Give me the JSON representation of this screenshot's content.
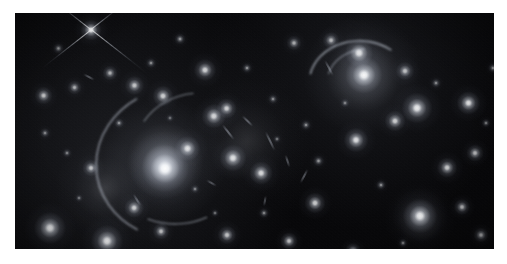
{
  "image": {
    "kind": "astronomical-photograph",
    "subject": "galaxy cluster with gravitational lensing arcs",
    "canvas_width": 507,
    "canvas_height": 264,
    "border_color": "#ffffff",
    "sky_background_color": "#040406",
    "plate": {
      "left": 15,
      "top": 13,
      "width": 479,
      "height": 236
    }
  },
  "diffuse_halos": [
    {
      "name": "central-cd-galaxy-halo",
      "cx": 150,
      "cy": 148,
      "rx": 118,
      "ry": 62,
      "rot": -24,
      "peak": 0.42,
      "color": "#dfe4ee"
    },
    {
      "name": "central-cd-galaxy-core-halo",
      "cx": 148,
      "cy": 152,
      "rx": 60,
      "ry": 34,
      "rot": -24,
      "peak": 0.55,
      "color": "#eef1f7"
    },
    {
      "name": "northeast-group-halo",
      "cx": 348,
      "cy": 62,
      "rx": 78,
      "ry": 60,
      "rot": 0,
      "peak": 0.34,
      "color": "#dde2ec"
    },
    {
      "name": "intracluster-light-west",
      "cx": 90,
      "cy": 175,
      "rx": 70,
      "ry": 50,
      "rot": 10,
      "peak": 0.16,
      "color": "#c9cedb"
    },
    {
      "name": "intracluster-light-center",
      "cx": 232,
      "cy": 128,
      "rx": 86,
      "ry": 64,
      "rot": 0,
      "peak": 0.13,
      "color": "#c4c9d6"
    },
    {
      "name": "southeast-group-halo",
      "cx": 405,
      "cy": 206,
      "rx": 46,
      "ry": 36,
      "rot": 0,
      "peak": 0.18,
      "color": "#d6dbe5"
    }
  ],
  "objects": [
    {
      "name": "bright-star-with-diffraction-spikes",
      "type": "star",
      "cx": 76,
      "cy": 17,
      "r": 5.2,
      "mag": 1.0,
      "ell": 1.0,
      "rot": 0
    },
    {
      "name": "central-cd-galaxy-nucleus",
      "type": "elliptical-galaxy",
      "cx": 150,
      "cy": 155,
      "r": 12.0,
      "mag": 0.98,
      "ell": 1.15,
      "rot": -22
    },
    {
      "name": "galaxy-ne-bright-a",
      "type": "elliptical-galaxy",
      "cx": 349,
      "cy": 62,
      "r": 9.5,
      "mag": 0.96,
      "ell": 1.05,
      "rot": 0
    },
    {
      "name": "galaxy-ne-bright-b",
      "type": "elliptical-galaxy",
      "cx": 344,
      "cy": 40,
      "r": 7.2,
      "mag": 0.88,
      "ell": 1.0,
      "rot": 0
    },
    {
      "name": "galaxy-e-bright",
      "type": "elliptical-galaxy",
      "cx": 402,
      "cy": 95,
      "r": 7.8,
      "mag": 0.92,
      "ell": 1.0,
      "rot": 0
    },
    {
      "name": "galaxy-se-bright",
      "type": "elliptical-galaxy",
      "cx": 405,
      "cy": 203,
      "r": 8.6,
      "mag": 0.95,
      "ell": 1.0,
      "rot": 0
    },
    {
      "name": "galaxy-sw-bright-a",
      "type": "elliptical-galaxy",
      "cx": 35,
      "cy": 215,
      "r": 8.2,
      "mag": 0.93,
      "ell": 1.05,
      "rot": 0
    },
    {
      "name": "galaxy-sw-bright-b",
      "type": "elliptical-galaxy",
      "cx": 92,
      "cy": 228,
      "r": 8.0,
      "mag": 0.92,
      "ell": 1.0,
      "rot": 0
    },
    {
      "name": "galaxy-edge-on-spiral",
      "type": "edge-on-spiral",
      "cx": 453,
      "cy": 90,
      "r": 6.0,
      "mag": 0.9,
      "ell": 3.4,
      "rot": -8
    },
    {
      "name": "galaxy-center-north",
      "type": "elliptical-galaxy",
      "cx": 173,
      "cy": 135,
      "r": 6.4,
      "mag": 0.86,
      "ell": 1.1,
      "rot": -20
    },
    {
      "name": "galaxy-center-east",
      "type": "elliptical-galaxy",
      "cx": 218,
      "cy": 145,
      "r": 6.8,
      "mag": 0.88,
      "ell": 1.15,
      "rot": 10
    },
    {
      "name": "galaxy-center-lens-a",
      "type": "elliptical-galaxy",
      "cx": 199,
      "cy": 103,
      "r": 6.2,
      "mag": 0.84,
      "ell": 1.3,
      "rot": 35
    },
    {
      "name": "galaxy-center-lens-b",
      "type": "elliptical-galaxy",
      "cx": 212,
      "cy": 96,
      "r": 5.2,
      "mag": 0.8,
      "ell": 1.6,
      "rot": 40
    },
    {
      "name": "galaxy-mid-north",
      "type": "elliptical-galaxy",
      "cx": 190,
      "cy": 57,
      "r": 5.6,
      "mag": 0.82,
      "ell": 1.0,
      "rot": 0
    },
    {
      "name": "galaxy-mid-east",
      "type": "elliptical-galaxy",
      "cx": 246,
      "cy": 160,
      "r": 6.0,
      "mag": 0.85,
      "ell": 1.4,
      "rot": 25
    },
    {
      "name": "galaxy-east-field-a",
      "type": "elliptical-galaxy",
      "cx": 341,
      "cy": 127,
      "r": 6.4,
      "mag": 0.87,
      "ell": 1.15,
      "rot": 0
    },
    {
      "name": "galaxy-east-field-b",
      "type": "elliptical-galaxy",
      "cx": 380,
      "cy": 108,
      "r": 5.4,
      "mag": 0.8,
      "ell": 1.1,
      "rot": 0
    },
    {
      "name": "galaxy-east-field-c",
      "type": "elliptical-galaxy",
      "cx": 432,
      "cy": 155,
      "r": 5.2,
      "mag": 0.78,
      "ell": 1.5,
      "rot": 70
    },
    {
      "name": "galaxy-east-field-d",
      "type": "elliptical-galaxy",
      "cx": 460,
      "cy": 140,
      "r": 4.4,
      "mag": 0.72,
      "ell": 1.2,
      "rot": 0
    },
    {
      "name": "galaxy-ne-field-a",
      "type": "elliptical-galaxy",
      "cx": 390,
      "cy": 58,
      "r": 4.6,
      "mag": 0.74,
      "ell": 1.3,
      "rot": 0
    },
    {
      "name": "galaxy-ne-field-b",
      "type": "elliptical-galaxy",
      "cx": 316,
      "cy": 27,
      "r": 4.2,
      "mag": 0.7,
      "ell": 2.1,
      "rot": 60
    },
    {
      "name": "galaxy-ne-field-c",
      "type": "elliptical-galaxy",
      "cx": 279,
      "cy": 30,
      "r": 3.6,
      "mag": 0.66,
      "ell": 1.0,
      "rot": 0
    },
    {
      "name": "galaxy-nw-field-a",
      "type": "elliptical-galaxy",
      "cx": 120,
      "cy": 72,
      "r": 4.8,
      "mag": 0.76,
      "ell": 1.6,
      "rot": 45
    },
    {
      "name": "galaxy-nw-field-b",
      "type": "elliptical-galaxy",
      "cx": 148,
      "cy": 83,
      "r": 5.4,
      "mag": 0.8,
      "ell": 1.25,
      "rot": 0
    },
    {
      "name": "galaxy-nw-field-c",
      "type": "elliptical-galaxy",
      "cx": 95,
      "cy": 60,
      "r": 3.8,
      "mag": 0.68,
      "ell": 1.0,
      "rot": 0
    },
    {
      "name": "galaxy-w-field-a",
      "type": "elliptical-galaxy",
      "cx": 28,
      "cy": 83,
      "r": 4.6,
      "mag": 0.76,
      "ell": 2.0,
      "rot": 25
    },
    {
      "name": "galaxy-w-field-b",
      "type": "elliptical-galaxy",
      "cx": 60,
      "cy": 75,
      "r": 3.6,
      "mag": 0.66,
      "ell": 1.7,
      "rot": 40
    },
    {
      "name": "galaxy-w-field-c",
      "type": "elliptical-galaxy",
      "cx": 76,
      "cy": 155,
      "r": 4.4,
      "mag": 0.74,
      "ell": 1.1,
      "rot": 0
    },
    {
      "name": "galaxy-sw-field-a",
      "type": "elliptical-galaxy",
      "cx": 119,
      "cy": 195,
      "r": 5.0,
      "mag": 0.79,
      "ell": 1.7,
      "rot": 60
    },
    {
      "name": "galaxy-sw-field-b",
      "type": "elliptical-galaxy",
      "cx": 146,
      "cy": 218,
      "r": 4.2,
      "mag": 0.72,
      "ell": 1.5,
      "rot": 55
    },
    {
      "name": "galaxy-s-field-a",
      "type": "elliptical-galaxy",
      "cx": 212,
      "cy": 222,
      "r": 4.6,
      "mag": 0.76,
      "ell": 1.1,
      "rot": 0
    },
    {
      "name": "galaxy-s-field-b",
      "type": "elliptical-galaxy",
      "cx": 274,
      "cy": 228,
      "r": 4.4,
      "mag": 0.74,
      "ell": 1.0,
      "rot": 0
    },
    {
      "name": "galaxy-s-field-c",
      "type": "elliptical-galaxy",
      "cx": 300,
      "cy": 190,
      "r": 5.2,
      "mag": 0.79,
      "ell": 1.0,
      "rot": 0
    },
    {
      "name": "galaxy-s-field-d",
      "type": "elliptical-galaxy",
      "cx": 338,
      "cy": 238,
      "r": 4.0,
      "mag": 0.7,
      "ell": 1.0,
      "rot": 0
    },
    {
      "name": "galaxy-se-field-a",
      "type": "elliptical-galaxy",
      "cx": 447,
      "cy": 194,
      "r": 4.2,
      "mag": 0.72,
      "ell": 1.0,
      "rot": 0
    },
    {
      "name": "galaxy-se-field-b",
      "type": "elliptical-galaxy",
      "cx": 466,
      "cy": 222,
      "r": 3.8,
      "mag": 0.68,
      "ell": 1.4,
      "rot": 0
    },
    {
      "name": "galaxy-field-029",
      "type": "faint",
      "cx": 44,
      "cy": 35,
      "r": 2.6,
      "mag": 0.55,
      "ell": 1.4,
      "rot": 30
    },
    {
      "name": "galaxy-field-030",
      "type": "faint",
      "cx": 30,
      "cy": 120,
      "r": 2.4,
      "mag": 0.52,
      "ell": 1.0,
      "rot": 0
    },
    {
      "name": "galaxy-field-031",
      "type": "faint",
      "cx": 52,
      "cy": 140,
      "r": 2.2,
      "mag": 0.5,
      "ell": 1.0,
      "rot": 0
    },
    {
      "name": "galaxy-field-032",
      "type": "faint",
      "cx": 104,
      "cy": 110,
      "r": 2.6,
      "mag": 0.56,
      "ell": 1.2,
      "rot": 0
    },
    {
      "name": "galaxy-field-033",
      "type": "faint",
      "cx": 136,
      "cy": 50,
      "r": 2.4,
      "mag": 0.54,
      "ell": 1.0,
      "rot": 0
    },
    {
      "name": "galaxy-field-034",
      "type": "faint",
      "cx": 165,
      "cy": 26,
      "r": 2.8,
      "mag": 0.58,
      "ell": 1.0,
      "rot": 0
    },
    {
      "name": "galaxy-field-035",
      "type": "faint",
      "cx": 232,
      "cy": 55,
      "r": 2.6,
      "mag": 0.56,
      "ell": 1.0,
      "rot": 0
    },
    {
      "name": "galaxy-field-036",
      "type": "faint",
      "cx": 258,
      "cy": 86,
      "r": 2.4,
      "mag": 0.53,
      "ell": 1.0,
      "rot": 0
    },
    {
      "name": "galaxy-field-037",
      "type": "faint",
      "cx": 291,
      "cy": 112,
      "r": 2.6,
      "mag": 0.55,
      "ell": 1.0,
      "rot": 0
    },
    {
      "name": "galaxy-field-038",
      "type": "faint",
      "cx": 304,
      "cy": 148,
      "r": 2.8,
      "mag": 0.58,
      "ell": 1.3,
      "rot": 20
    },
    {
      "name": "galaxy-field-039",
      "type": "faint",
      "cx": 366,
      "cy": 172,
      "r": 2.6,
      "mag": 0.55,
      "ell": 1.0,
      "rot": 0
    },
    {
      "name": "galaxy-field-040",
      "type": "faint",
      "cx": 421,
      "cy": 70,
      "r": 2.4,
      "mag": 0.53,
      "ell": 1.0,
      "rot": 0
    },
    {
      "name": "galaxy-field-041",
      "type": "faint",
      "cx": 478,
      "cy": 55,
      "r": 2.6,
      "mag": 0.56,
      "ell": 1.0,
      "rot": 0
    },
    {
      "name": "galaxy-field-042",
      "type": "faint",
      "cx": 471,
      "cy": 110,
      "r": 2.2,
      "mag": 0.5,
      "ell": 1.0,
      "rot": 0
    },
    {
      "name": "galaxy-field-043",
      "type": "faint",
      "cx": 249,
      "cy": 200,
      "r": 2.4,
      "mag": 0.52,
      "ell": 1.0,
      "rot": 0
    },
    {
      "name": "galaxy-field-044",
      "type": "faint",
      "cx": 180,
      "cy": 176,
      "r": 2.2,
      "mag": 0.5,
      "ell": 1.0,
      "rot": 0
    },
    {
      "name": "galaxy-field-045",
      "type": "faint",
      "cx": 200,
      "cy": 200,
      "r": 2.0,
      "mag": 0.46,
      "ell": 1.0,
      "rot": 0
    },
    {
      "name": "galaxy-field-046",
      "type": "faint",
      "cx": 388,
      "cy": 230,
      "r": 2.2,
      "mag": 0.5,
      "ell": 1.0,
      "rot": 0
    },
    {
      "name": "galaxy-field-047",
      "type": "faint",
      "cx": 64,
      "cy": 185,
      "r": 2.0,
      "mag": 0.46,
      "ell": 1.0,
      "rot": 0
    },
    {
      "name": "galaxy-field-048",
      "type": "faint",
      "cx": 262,
      "cy": 126,
      "r": 2.0,
      "mag": 0.46,
      "ell": 1.0,
      "rot": 0
    },
    {
      "name": "galaxy-field-049",
      "type": "faint",
      "cx": 330,
      "cy": 90,
      "r": 2.2,
      "mag": 0.5,
      "ell": 1.0,
      "rot": 0
    },
    {
      "name": "galaxy-field-050",
      "type": "faint",
      "cx": 155,
      "cy": 105,
      "r": 1.8,
      "mag": 0.44,
      "ell": 1.0,
      "rot": 0
    }
  ],
  "lensing_arcs": [
    {
      "name": "giant-tangential-arc-north",
      "cx": 346,
      "cy": 72,
      "rx": 52,
      "ry": 44,
      "rot": 6,
      "start_deg": 188,
      "sweep_deg": 112,
      "thickness": 1.6,
      "mag": 0.62
    },
    {
      "name": "tangential-arc-northwest",
      "cx": 352,
      "cy": 70,
      "rx": 40,
      "ry": 34,
      "rot": 0,
      "start_deg": 196,
      "sweep_deg": 70,
      "thickness": 1.2,
      "mag": 0.48
    },
    {
      "name": "giant-arc-west-of-cd",
      "cx": 165,
      "cy": 150,
      "rx": 84,
      "ry": 76,
      "rot": -8,
      "start_deg": 128,
      "sweep_deg": 118,
      "thickness": 1.6,
      "mag": 0.55
    },
    {
      "name": "arc-southwest-of-cd",
      "cx": 160,
      "cy": 145,
      "rx": 72,
      "ry": 66,
      "rot": 0,
      "start_deg": 64,
      "sweep_deg": 48,
      "thickness": 1.3,
      "mag": 0.45
    },
    {
      "name": "arc-north-of-cd",
      "cx": 185,
      "cy": 140,
      "rx": 66,
      "ry": 60,
      "rot": 0,
      "start_deg": 212,
      "sweep_deg": 52,
      "thickness": 1.2,
      "mag": 0.42
    }
  ],
  "arclets": [
    {
      "name": "arclet-a",
      "cx": 213,
      "cy": 119,
      "len": 22,
      "w": 2.4,
      "rot": 52,
      "mag": 0.66
    },
    {
      "name": "arclet-b",
      "cx": 232,
      "cy": 108,
      "len": 17,
      "w": 2.2,
      "rot": 44,
      "mag": 0.6
    },
    {
      "name": "arclet-c",
      "cx": 255,
      "cy": 128,
      "len": 24,
      "w": 2.4,
      "rot": 64,
      "mag": 0.62
    },
    {
      "name": "arclet-d",
      "cx": 272,
      "cy": 148,
      "len": 15,
      "w": 2.0,
      "rot": 72,
      "mag": 0.55
    },
    {
      "name": "arclet-e",
      "cx": 196,
      "cy": 170,
      "len": 13,
      "w": 2.0,
      "rot": 30,
      "mag": 0.52
    },
    {
      "name": "arclet-f",
      "cx": 289,
      "cy": 163,
      "len": 18,
      "w": 2.2,
      "rot": 118,
      "mag": 0.58
    },
    {
      "name": "arclet-g",
      "cx": 122,
      "cy": 187,
      "len": 16,
      "w": 2.2,
      "rot": 58,
      "mag": 0.56
    },
    {
      "name": "arclet-h",
      "cx": 74,
      "cy": 64,
      "len": 14,
      "w": 2.0,
      "rot": 28,
      "mag": 0.54
    },
    {
      "name": "arclet-i",
      "cx": 314,
      "cy": 55,
      "len": 20,
      "w": 2.0,
      "rot": 62,
      "mag": 0.58
    },
    {
      "name": "arclet-j",
      "cx": 250,
      "cy": 188,
      "len": 12,
      "w": 1.8,
      "rot": 100,
      "mag": 0.48
    }
  ],
  "diffraction_spikes": {
    "name": "star-diffraction-spikes",
    "star": "bright-star-with-diffraction-spikes",
    "cx": 76,
    "cy": 17,
    "arms": [
      {
        "angle_deg": 38,
        "length": 70,
        "width": 1.4
      },
      {
        "angle_deg": 142,
        "length": 62,
        "width": 1.4
      },
      {
        "angle_deg": 218,
        "length": 44,
        "width": 1.2
      },
      {
        "angle_deg": 322,
        "length": 40,
        "width": 1.2
      }
    ]
  }
}
